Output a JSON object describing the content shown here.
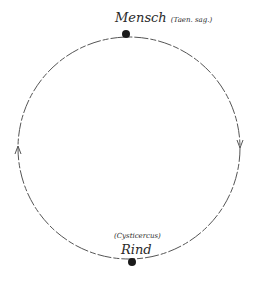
{
  "diagram": {
    "type": "cycle",
    "nodes": [
      {
        "id": "top",
        "label": "Mensch",
        "sublabel": "(Taen. sag.)"
      },
      {
        "id": "bottom",
        "label": "Rind",
        "sublabel": "(Cysticercus)"
      }
    ],
    "edges": [
      {
        "from": "top",
        "to": "bottom",
        "side": "right",
        "direction": "down"
      },
      {
        "from": "bottom",
        "to": "top",
        "side": "left",
        "direction": "up"
      }
    ],
    "colors": {
      "line": "#555555",
      "dot": "#1a1a1a",
      "text": "#2a2a2a"
    }
  }
}
